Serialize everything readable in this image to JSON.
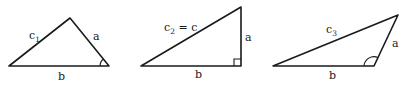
{
  "figure": {
    "triangles": [
      {
        "id": "acute",
        "points": [
          [
            9,
            66
          ],
          [
            109,
            66
          ],
          [
            70,
            18
          ]
        ],
        "labels": {
          "hyp": "c",
          "hyp_sub": "1",
          "side": "a",
          "base": "b"
        },
        "angle_marker": "acute-arc"
      },
      {
        "id": "right",
        "points": [
          [
            141,
            66
          ],
          [
            241,
            66
          ],
          [
            241,
            7
          ]
        ],
        "labels": {
          "hyp": "c",
          "hyp_sub": "2",
          "hyp_eq": " = c",
          "side": "a",
          "base": "b"
        },
        "angle_marker": "right-angle-box"
      },
      {
        "id": "obtuse",
        "points": [
          [
            273,
            66
          ],
          [
            374,
            66
          ],
          [
            398,
            15
          ]
        ],
        "labels": {
          "hyp": "c",
          "hyp_sub": "3",
          "side": "a",
          "base": "b"
        },
        "angle_marker": "obtuse-arc"
      }
    ],
    "colors": {
      "stroke": "#1a1a1a",
      "background": "#ffffff"
    }
  }
}
